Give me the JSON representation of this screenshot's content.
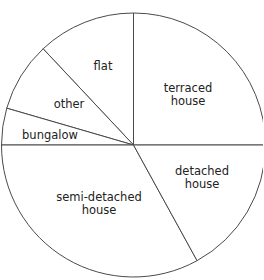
{
  "chart_data": {
    "type": "pie",
    "title": "",
    "start_angle_deg": 0,
    "direction": "counterclockwise",
    "center": [
      133.5,
      145
    ],
    "radius": 132,
    "categories": [
      "terraced house",
      "flat",
      "other",
      "bungalow",
      "semi-detached house",
      "detached house"
    ],
    "values": [
      25,
      12,
      8.5,
      4.5,
      33,
      17
    ],
    "unit": "%",
    "slices": [
      {
        "label": "terraced house",
        "value": 25,
        "label_lines": [
          "terraced",
          "house"
        ],
        "label_pos": [
          188,
          94
        ]
      },
      {
        "label": "flat",
        "value": 12,
        "label_lines": [
          "flat"
        ],
        "label_pos": [
          103,
          66
        ]
      },
      {
        "label": "other",
        "value": 8.5,
        "label_lines": [
          "other"
        ],
        "label_pos": [
          69,
          104
        ]
      },
      {
        "label": "bungalow",
        "value": 4.5,
        "label_lines": [
          "bungalow"
        ],
        "label_pos": [
          50,
          135
        ]
      },
      {
        "label": "semi-detached house",
        "value": 33,
        "label_lines": [
          "semi-detached",
          "house"
        ],
        "label_pos": [
          99,
          203
        ]
      },
      {
        "label": "detached house",
        "value": 17,
        "label_lines": [
          "detached",
          "house"
        ],
        "label_pos": [
          202,
          177
        ]
      }
    ],
    "legend": "none (labels inside slices)"
  },
  "colors": {
    "slice_fill": "#ffffff",
    "stroke": "#4a4a4a",
    "text": "#222222"
  }
}
